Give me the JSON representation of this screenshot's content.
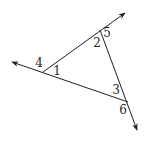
{
  "diagram": {
    "stroke_color": "#231f20",
    "lines": [
      {
        "name": "line-top-left-to-top-right",
        "from": [
          43,
          72
        ],
        "to": [
          125,
          13
        ],
        "arrow": "end"
      },
      {
        "name": "line-left-to-bottom-right",
        "from": [
          128,
          102
        ],
        "to": [
          12,
          62
        ],
        "arrow": "end"
      },
      {
        "name": "line-top-to-bottom",
        "from": [
          100,
          30
        ],
        "to": [
          137,
          130
        ],
        "arrow": "end"
      }
    ],
    "angle_labels": [
      {
        "id": "1",
        "text": "1",
        "x": 57,
        "y": 71
      },
      {
        "id": "2",
        "text": "2",
        "x": 97,
        "y": 43
      },
      {
        "id": "3",
        "text": "3",
        "x": 116,
        "y": 90
      },
      {
        "id": "4",
        "text": "4",
        "x": 39,
        "y": 63
      },
      {
        "id": "5",
        "text": "5",
        "x": 107,
        "y": 33
      },
      {
        "id": "6",
        "text": "6",
        "x": 123,
        "y": 110
      }
    ]
  }
}
